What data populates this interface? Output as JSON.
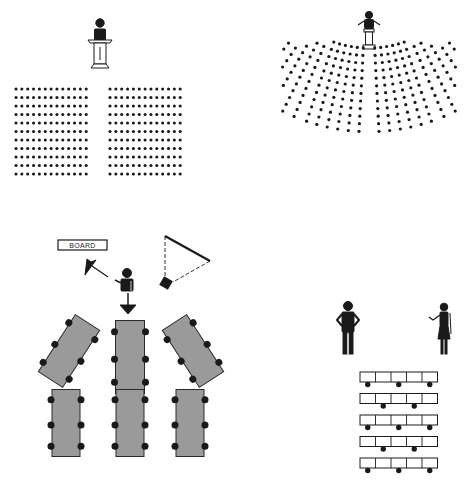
{
  "diagram": {
    "colors": {
      "ink": "#1a1a1a",
      "table_fill": "#9a9a9a",
      "table_stroke": "#2a2a2a",
      "background": "#ffffff"
    },
    "panels": [
      {
        "id": "theater",
        "name": "Theater style",
        "speaker": "speaker at lectern",
        "blocks": [
          {
            "rows": 11,
            "cols": 13,
            "x0": 16,
            "y0": 89,
            "dx": 5.85,
            "dy": 8.5
          },
          {
            "rows": 11,
            "cols": 13,
            "x0": 110,
            "y0": 89,
            "dx": 5.85,
            "dy": 8.5
          }
        ]
      },
      {
        "id": "auditorium",
        "name": "Curved auditorium style",
        "speaker": "speaker at lectern with raised arms",
        "sections": 4
      },
      {
        "id": "classroom",
        "name": "Classroom table clusters",
        "board_label": "BOARD",
        "elements": [
          "board",
          "instructor",
          "projector screen",
          "projector"
        ],
        "tables": 6,
        "chairs_per_table": 6
      },
      {
        "id": "seminar",
        "name": "Seminar rows",
        "presenters": [
          "man with hands on hips",
          "woman gesturing"
        ],
        "table_rows": 5,
        "segments_per_row": 5,
        "chairs_per_row": [
          3,
          2,
          3,
          2,
          3
        ]
      }
    ]
  }
}
